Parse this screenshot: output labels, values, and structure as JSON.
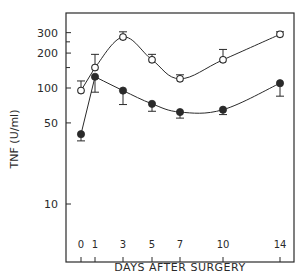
{
  "chart_data": {
    "type": "line",
    "title": "",
    "xlabel": "DAYS AFTER SURGERY",
    "ylabel": "TNF (U/ml)",
    "yscale": "log",
    "ylim": [
      7,
      400
    ],
    "xlim": [
      -1,
      15
    ],
    "x": [
      0,
      1,
      3,
      5,
      7,
      10,
      14
    ],
    "x_tick_labels": [
      "0",
      "1",
      "3",
      "5",
      "7",
      "10",
      "14"
    ],
    "y_ticks": [
      10,
      50,
      100,
      200,
      300
    ],
    "y_tick_labels": [
      "10",
      "50",
      "100",
      "200",
      "300"
    ],
    "y_minor_ticks": [
      150,
      250
    ],
    "grid": false,
    "legend": null,
    "series": [
      {
        "name": "open circles",
        "marker": "open-circle",
        "smooth": true,
        "values": [
          95,
          150,
          275,
          175,
          120,
          175,
          290
        ],
        "error_up": [
          115,
          195,
          305,
          195,
          130,
          215,
          305
        ],
        "error_down": [
          null,
          null,
          null,
          null,
          null,
          null,
          null
        ]
      },
      {
        "name": "filled circles",
        "marker": "filled-circle",
        "smooth": true,
        "values": [
          40,
          125,
          95,
          73,
          62,
          65,
          110
        ],
        "error_up": [
          null,
          null,
          null,
          null,
          null,
          null,
          null
        ],
        "error_down": [
          35,
          92,
          72,
          63,
          55,
          59,
          85
        ]
      }
    ]
  },
  "colors": {
    "ink": "#2a2a2a",
    "background": "#ffffff"
  }
}
